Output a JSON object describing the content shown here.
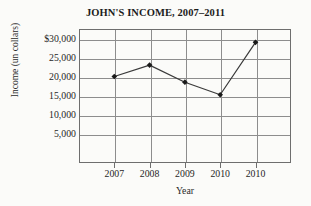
{
  "title": "JOHN'S INCOME, 2007–2011",
  "axes": {
    "x_title": "Year",
    "y_title": "Income (un collars)",
    "y_ticks": [
      "$30,000",
      "25,000",
      "20,000",
      "15,000",
      "10,000",
      "5,000"
    ],
    "x_ticks": [
      "2007",
      "2008",
      "2009",
      "2010",
      "2010"
    ]
  },
  "style": {
    "grid_color": "#8d8d8d",
    "frame_color": "#6e6e6e",
    "series_color": "#3a3a3a",
    "marker_color": "#1a1a1a",
    "background": "#fbfbf9"
  },
  "chart_data": {
    "type": "line",
    "title": "JOHN'S INCOME, 2007–2011",
    "xlabel": "Year",
    "ylabel": "Income (un collars)",
    "categories": [
      "2007",
      "2008",
      "2009",
      "2010",
      "2010"
    ],
    "values": [
      20000,
      23000,
      18500,
      15200,
      29000
    ],
    "ylim": [
      0,
      32500
    ],
    "y_tick_values": [
      30000,
      25000,
      20000,
      15000,
      10000,
      5000
    ],
    "grid": true,
    "legend": false,
    "markers": "filled-diamond"
  }
}
